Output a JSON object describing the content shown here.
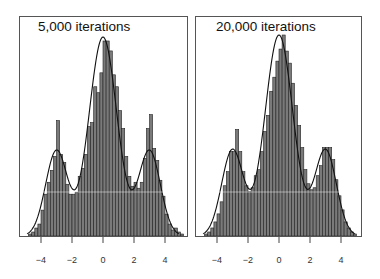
{
  "chart_data": [
    {
      "type": "bar",
      "subtype": "histogram_with_density",
      "title": "5,000 iterations",
      "xlabel": "",
      "ylabel": "",
      "xlim": [
        -5.1,
        5.6
      ],
      "xticks": [
        -4,
        -2,
        0,
        2,
        4
      ],
      "xtick_labels": [
        "-4",
        "-2",
        "0",
        "2",
        "4"
      ],
      "grid": false,
      "legend": null,
      "bin_width": 0.2,
      "bin_start": -4.8,
      "density_curve": {
        "components": [
          {
            "weight": 0.2,
            "mean": -3,
            "sd": 0.7
          },
          {
            "weight": 0.6,
            "mean": 0,
            "sd": 0.9
          },
          {
            "weight": 0.2,
            "mean": 3,
            "sd": 0.7
          }
        ]
      },
      "relative_heights": [
        0.01,
        0.02,
        0.04,
        0.06,
        0.13,
        0.21,
        0.27,
        0.33,
        0.4,
        0.58,
        0.41,
        0.37,
        0.26,
        0.21,
        0.21,
        0.22,
        0.3,
        0.34,
        0.41,
        0.55,
        0.57,
        0.75,
        0.72,
        0.82,
        0.98,
        0.98,
        0.93,
        0.81,
        0.75,
        0.63,
        0.54,
        0.4,
        0.3,
        0.25,
        0.27,
        0.24,
        0.27,
        0.39,
        0.54,
        0.61,
        0.44,
        0.38,
        0.28,
        0.2,
        0.11,
        0.06,
        0.03,
        0.04,
        0.02,
        0.01
      ]
    },
    {
      "type": "bar",
      "subtype": "histogram_with_density",
      "title": "20,000 iterations",
      "xlabel": "",
      "ylabel": "",
      "xlim": [
        -5.1,
        5.6
      ],
      "xticks": [
        -4,
        -2,
        0,
        2,
        4
      ],
      "xtick_labels": [
        "-4",
        "-2",
        "0",
        "2",
        "4"
      ],
      "grid": false,
      "legend": null,
      "bin_width": 0.2,
      "bin_start": -4.8,
      "density_curve": {
        "components": [
          {
            "weight": 0.2,
            "mean": -3,
            "sd": 0.7
          },
          {
            "weight": 0.6,
            "mean": 0,
            "sd": 0.9
          },
          {
            "weight": 0.2,
            "mean": 3,
            "sd": 0.7
          }
        ]
      },
      "relative_heights": [
        0.01,
        0.02,
        0.04,
        0.07,
        0.11,
        0.17,
        0.25,
        0.32,
        0.42,
        0.42,
        0.53,
        0.42,
        0.32,
        0.25,
        0.22,
        0.24,
        0.3,
        0.33,
        0.42,
        0.52,
        0.6,
        0.72,
        0.79,
        0.87,
        0.93,
        1.0,
        0.92,
        0.86,
        0.76,
        0.65,
        0.55,
        0.44,
        0.33,
        0.26,
        0.23,
        0.24,
        0.3,
        0.35,
        0.44,
        0.44,
        0.44,
        0.38,
        0.28,
        0.2,
        0.13,
        0.07,
        0.04,
        0.02,
        0.01,
        0.0
      ]
    }
  ],
  "panels": [
    {
      "title": "5,000 iterations"
    },
    {
      "title": "20,000 iterations"
    }
  ],
  "tick_labels": [
    "−4",
    "−2",
    "0",
    "2",
    "4"
  ]
}
